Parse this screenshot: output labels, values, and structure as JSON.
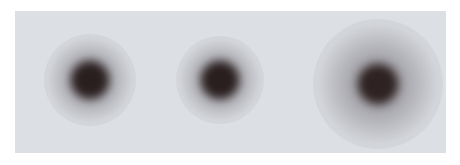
{
  "image": {
    "description": "Grayscale panel with three blurred dark spots",
    "background_color": "#dcdfe3",
    "spots": [
      {
        "label": "spot-1",
        "cx": 75,
        "cy": 69,
        "core": 38,
        "halo": 92,
        "core_color": "#2a1f1f"
      },
      {
        "label": "spot-2",
        "cx": 205,
        "cy": 69,
        "core": 38,
        "halo": 88,
        "core_color": "#2a1f1f"
      },
      {
        "label": "spot-3",
        "cx": 363,
        "cy": 73,
        "core": 40,
        "halo": 130,
        "core_color": "#2e2222"
      }
    ]
  }
}
